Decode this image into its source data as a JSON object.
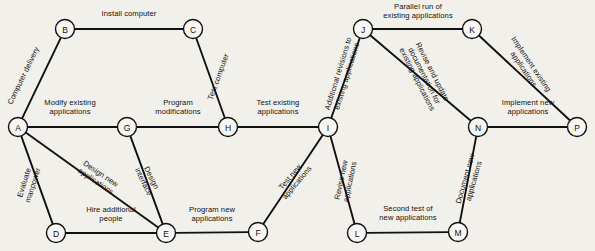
{
  "diagram": {
    "type": "activity-on-arrow-project-network",
    "background_color": "#f2f0eb",
    "line_color": "#111111",
    "nodes": [
      {
        "id": "A",
        "label": "A",
        "x": 18,
        "y": 127
      },
      {
        "id": "B",
        "label": "B",
        "x": 65,
        "y": 29
      },
      {
        "id": "C",
        "label": "C",
        "x": 193,
        "y": 29
      },
      {
        "id": "D",
        "label": "D",
        "x": 56,
        "y": 233
      },
      {
        "id": "E",
        "label": "E",
        "x": 166,
        "y": 233
      },
      {
        "id": "F",
        "label": "F",
        "x": 258,
        "y": 232
      },
      {
        "id": "G",
        "label": "G",
        "x": 127,
        "y": 127
      },
      {
        "id": "H",
        "label": "H",
        "x": 228,
        "y": 127
      },
      {
        "id": "I",
        "label": "I",
        "x": 328,
        "y": 127
      },
      {
        "id": "J",
        "label": "J",
        "x": 363,
        "y": 29
      },
      {
        "id": "K",
        "label": "K",
        "x": 472,
        "y": 29
      },
      {
        "id": "L",
        "label": "L",
        "x": 357,
        "y": 233
      },
      {
        "id": "M",
        "label": "M",
        "x": 458,
        "y": 232
      },
      {
        "id": "N",
        "label": "N",
        "x": 478,
        "y": 127
      },
      {
        "id": "P",
        "label": "P",
        "x": 577,
        "y": 127
      }
    ],
    "edges": [
      {
        "from": "A",
        "to": "B",
        "label": "Computer delivery",
        "label_x": 24,
        "label_y": 76,
        "rotate": -64,
        "align": "center"
      },
      {
        "from": "B",
        "to": "C",
        "label": "Install computer",
        "label_x": 129,
        "label_y": 14,
        "rotate": 0,
        "align": "center"
      },
      {
        "from": "C",
        "to": "H",
        "label": "Test computer",
        "label_x": 219,
        "label_y": 77,
        "rotate": -70,
        "align": "center"
      },
      {
        "from": "A",
        "to": "G",
        "label": "Modify existing\napplications",
        "label_x": 70,
        "label_y": 108,
        "rotate": 0,
        "align": "center"
      },
      {
        "from": "G",
        "to": "H",
        "label": "Program\nmodifications",
        "label_x": 178,
        "label_y": 108,
        "rotate": 0,
        "align": "center"
      },
      {
        "from": "H",
        "to": "I",
        "label": "Test existing\napplications",
        "label_x": 278,
        "label_y": 108,
        "rotate": 0,
        "align": "center"
      },
      {
        "from": "A",
        "to": "D",
        "label": "Evaluate\nmanpower",
        "label_x": 29,
        "label_y": 184,
        "rotate": -73,
        "align": "center"
      },
      {
        "from": "A",
        "to": "E",
        "label": "Design new\napplications",
        "label_x": 98,
        "label_y": 178,
        "rotate": 34,
        "align": "center"
      },
      {
        "from": "G",
        "to": "E",
        "label": "Design\ninterface",
        "label_x": 147,
        "label_y": 180,
        "rotate": 64,
        "align": "center"
      },
      {
        "from": "D",
        "to": "E",
        "label": "Hire additional\npeople",
        "label_x": 111,
        "label_y": 215,
        "rotate": 0,
        "align": "center"
      },
      {
        "from": "E",
        "to": "F",
        "label": "Program new\napplications",
        "label_x": 212,
        "label_y": 215,
        "rotate": 0,
        "align": "center"
      },
      {
        "from": "F",
        "to": "I",
        "label": "Test new\napplications",
        "label_x": 294,
        "label_y": 180,
        "rotate": -50,
        "align": "center"
      },
      {
        "from": "I",
        "to": "J",
        "label": "Additional revisions to\nexisting applications",
        "label_x": 343,
        "label_y": 75,
        "rotate": -73,
        "align": "center"
      },
      {
        "from": "J",
        "to": "K",
        "label": "Parallel run of\nexisting applications",
        "label_x": 418,
        "label_y": 12,
        "rotate": 0,
        "align": "center"
      },
      {
        "from": "J",
        "to": "N",
        "label": "Revise and update\ndocumentation for\nexisting applications",
        "label_x": 424,
        "label_y": 76,
        "rotate": 63,
        "align": "center"
      },
      {
        "from": "K",
        "to": "P",
        "label": "Implement existing\napplications",
        "label_x": 527,
        "label_y": 67,
        "rotate": 56,
        "align": "center"
      },
      {
        "from": "N",
        "to": "P",
        "label": "Implement new\napplications",
        "label_x": 528,
        "label_y": 108,
        "rotate": 0,
        "align": "center"
      },
      {
        "from": "I",
        "to": "L",
        "label": "Revise new\napplications",
        "label_x": 346,
        "label_y": 181,
        "rotate": -78,
        "align": "center"
      },
      {
        "from": "L",
        "to": "M",
        "label": "Second test of\nnew applications",
        "label_x": 408,
        "label_y": 214,
        "rotate": 0,
        "align": "center"
      },
      {
        "from": "M",
        "to": "N",
        "label": "Document new\napplications",
        "label_x": 470,
        "label_y": 180,
        "rotate": -74,
        "align": "center"
      }
    ]
  }
}
